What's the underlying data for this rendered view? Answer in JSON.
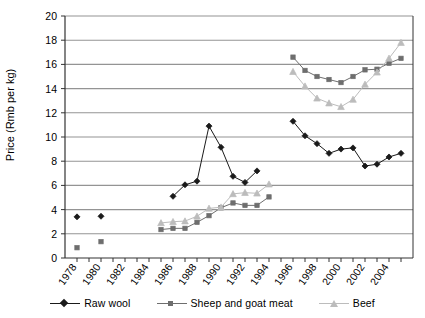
{
  "chart_data": {
    "type": "line",
    "title": "",
    "xlabel": "",
    "ylabel": "Price (Rmb per kg)",
    "ylim": [
      0,
      20
    ],
    "ytick_step": 2,
    "yticks": [
      "0",
      "2",
      "4",
      "6",
      "8",
      "10",
      "12",
      "14",
      "16",
      "18",
      "20"
    ],
    "xlim": [
      1977,
      2006
    ],
    "xticks": [
      "1978",
      "1980",
      "1982",
      "1984",
      "1986",
      "1988",
      "1990",
      "1992",
      "1994",
      "1996",
      "1998",
      "2000",
      "2002",
      "2004"
    ],
    "xtick_step": 2,
    "grid": "horizontal",
    "legend_position": "bottom",
    "series": [
      {
        "name": "Raw wool",
        "marker": "diamond",
        "color": "#1a1a1a",
        "points": [
          {
            "x": 1978,
            "y": 3.4,
            "connect": false
          },
          {
            "x": 1980,
            "y": 3.45,
            "connect": false
          },
          {
            "x": 1986,
            "y": 5.1,
            "connect": false
          },
          {
            "x": 1987,
            "y": 6.05,
            "connect": true
          },
          {
            "x": 1988,
            "y": 6.35,
            "connect": true
          },
          {
            "x": 1989,
            "y": 10.9,
            "connect": true
          },
          {
            "x": 1990,
            "y": 9.15,
            "connect": true
          },
          {
            "x": 1991,
            "y": 6.75,
            "connect": true
          },
          {
            "x": 1992,
            "y": 6.25,
            "connect": true
          },
          {
            "x": 1993,
            "y": 7.2,
            "connect": true
          },
          {
            "x": 1996,
            "y": 11.3,
            "connect": false
          },
          {
            "x": 1997,
            "y": 10.1,
            "connect": true
          },
          {
            "x": 1998,
            "y": 9.45,
            "connect": true
          },
          {
            "x": 1999,
            "y": 8.65,
            "connect": true
          },
          {
            "x": 2000,
            "y": 9.0,
            "connect": true
          },
          {
            "x": 2001,
            "y": 9.1,
            "connect": true
          },
          {
            "x": 2002,
            "y": 7.6,
            "connect": true
          },
          {
            "x": 2003,
            "y": 7.75,
            "connect": true
          },
          {
            "x": 2004,
            "y": 8.35,
            "connect": true
          },
          {
            "x": 2005,
            "y": 8.65,
            "connect": true
          }
        ]
      },
      {
        "name": "Sheep and goat meat",
        "marker": "square",
        "color": "#6e6e6e",
        "points": [
          {
            "x": 1978,
            "y": 0.85,
            "connect": false
          },
          {
            "x": 1980,
            "y": 1.35,
            "connect": false
          },
          {
            "x": 1985,
            "y": 2.35,
            "connect": false
          },
          {
            "x": 1986,
            "y": 2.45,
            "connect": true
          },
          {
            "x": 1987,
            "y": 2.45,
            "connect": true
          },
          {
            "x": 1988,
            "y": 2.95,
            "connect": true
          },
          {
            "x": 1989,
            "y": 3.5,
            "connect": true
          },
          {
            "x": 1990,
            "y": 4.15,
            "connect": true
          },
          {
            "x": 1991,
            "y": 4.55,
            "connect": true
          },
          {
            "x": 1992,
            "y": 4.35,
            "connect": true
          },
          {
            "x": 1993,
            "y": 4.35,
            "connect": true
          },
          {
            "x": 1994,
            "y": 5.05,
            "connect": true
          },
          {
            "x": 1996,
            "y": 16.6,
            "connect": false
          },
          {
            "x": 1997,
            "y": 15.5,
            "connect": true
          },
          {
            "x": 1998,
            "y": 15.0,
            "connect": true
          },
          {
            "x": 1999,
            "y": 14.75,
            "connect": true
          },
          {
            "x": 2000,
            "y": 14.5,
            "connect": true
          },
          {
            "x": 2001,
            "y": 15.0,
            "connect": true
          },
          {
            "x": 2002,
            "y": 15.55,
            "connect": true
          },
          {
            "x": 2003,
            "y": 15.6,
            "connect": true
          },
          {
            "x": 2004,
            "y": 16.1,
            "connect": true
          },
          {
            "x": 2005,
            "y": 16.5,
            "connect": true
          }
        ]
      },
      {
        "name": "Beef",
        "marker": "triangle",
        "color": "#bcbcbc",
        "points": [
          {
            "x": 1985,
            "y": 2.9,
            "connect": false
          },
          {
            "x": 1986,
            "y": 3.0,
            "connect": true
          },
          {
            "x": 1987,
            "y": 3.05,
            "connect": true
          },
          {
            "x": 1988,
            "y": 3.45,
            "connect": true
          },
          {
            "x": 1989,
            "y": 4.1,
            "connect": true
          },
          {
            "x": 1990,
            "y": 4.2,
            "connect": true
          },
          {
            "x": 1991,
            "y": 5.3,
            "connect": true
          },
          {
            "x": 1992,
            "y": 5.4,
            "connect": true
          },
          {
            "x": 1993,
            "y": 5.35,
            "connect": true
          },
          {
            "x": 1994,
            "y": 6.1,
            "connect": true
          },
          {
            "x": 1996,
            "y": 15.4,
            "connect": false
          },
          {
            "x": 1997,
            "y": 14.2,
            "connect": true
          },
          {
            "x": 1998,
            "y": 13.2,
            "connect": true
          },
          {
            "x": 1999,
            "y": 12.8,
            "connect": true
          },
          {
            "x": 2000,
            "y": 12.5,
            "connect": true
          },
          {
            "x": 2001,
            "y": 13.1,
            "connect": true
          },
          {
            "x": 2002,
            "y": 14.35,
            "connect": true
          },
          {
            "x": 2003,
            "y": 15.35,
            "connect": true
          },
          {
            "x": 2004,
            "y": 16.5,
            "connect": true
          },
          {
            "x": 2005,
            "y": 17.8,
            "connect": true
          }
        ]
      }
    ]
  },
  "legend": {
    "items": [
      {
        "label": "Raw wool",
        "marker": "diamond",
        "color": "#1a1a1a"
      },
      {
        "label": "Sheep and goat meat",
        "marker": "square",
        "color": "#6e6e6e"
      },
      {
        "label": "Beef",
        "marker": "triangle",
        "color": "#bcbcbc"
      }
    ]
  },
  "axis": {
    "y_title": "Price (Rmb per kg)"
  }
}
